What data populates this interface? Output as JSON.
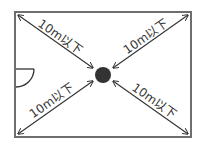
{
  "diagram": {
    "type": "room-layout",
    "colors": {
      "wall": "#6e6e6e",
      "arrow": "#333333",
      "center_point": "#333333",
      "background": "#ffffff"
    },
    "room": {
      "x": 15,
      "y": 12,
      "width": 176,
      "height": 125
    },
    "center_point": {
      "cx": 103,
      "cy": 75,
      "r": 8,
      "shape": "filled-circle"
    },
    "door": {
      "wall": "left",
      "hinge_y": 69,
      "radius": 18
    },
    "distances": [
      {
        "id": "top-left",
        "label": "10m以下"
      },
      {
        "id": "top-right",
        "label": "10m以下"
      },
      {
        "id": "bottom-left",
        "label": "10m以下"
      },
      {
        "id": "bottom-right",
        "label": "10m以下"
      }
    ]
  }
}
